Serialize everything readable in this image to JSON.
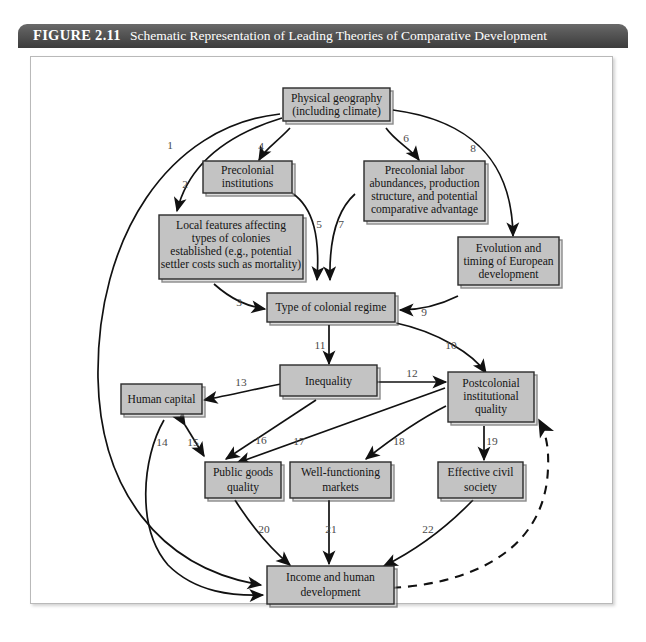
{
  "figure": {
    "number": "FIGURE 2.11",
    "title": "Schematic Representation of Leading Theories of Comparative Development"
  },
  "colors": {
    "header_bg": "#3c3c3c",
    "header_text": "#ffffff",
    "node_fill": "#c3c3c3",
    "node_border": "#2b2b2b",
    "edge": "#111111",
    "edge_label": "#4a4a4a",
    "page_bg": "#ffffff"
  },
  "diagram": {
    "type": "flowchart",
    "nodes": [
      {
        "id": "geo",
        "label": "Physical geography\n(including climate)"
      },
      {
        "id": "precol_inst",
        "label": "Precolonial\ninstitutions"
      },
      {
        "id": "precol_lab",
        "label": "Precolonial labor\nabundances, production\nstructure, and potential\ncomparative advantage"
      },
      {
        "id": "local",
        "label": "Local features affecting\ntypes of colonies\nestablished (e.g., potential\nsettler costs such as mortality)"
      },
      {
        "id": "euro",
        "label": "Evolution and\ntiming of European\ndevelopment"
      },
      {
        "id": "regime",
        "label": "Type of colonial regime"
      },
      {
        "id": "inequality",
        "label": "Inequality"
      },
      {
        "id": "postcol",
        "label": "Postcolonial\ninstitutional\nquality"
      },
      {
        "id": "human",
        "label": "Human capital"
      },
      {
        "id": "public",
        "label": "Public goods\nquality"
      },
      {
        "id": "markets",
        "label": "Well-functioning\nmarkets"
      },
      {
        "id": "civil",
        "label": "Effective civil\nsociety"
      },
      {
        "id": "income",
        "label": "Income and human\ndevelopment"
      }
    ],
    "edges": [
      {
        "label": "1",
        "from": "geo",
        "to": "income",
        "style": "solid",
        "arrows": "one"
      },
      {
        "label": "2",
        "from": "geo",
        "to": "local",
        "style": "solid",
        "arrows": "one"
      },
      {
        "label": "3",
        "from": "local",
        "to": "regime",
        "style": "solid",
        "arrows": "one"
      },
      {
        "label": "4",
        "from": "geo",
        "to": "precol_inst",
        "style": "solid",
        "arrows": "one"
      },
      {
        "label": "5",
        "from": "precol_inst",
        "to": "regime",
        "style": "solid",
        "arrows": "one"
      },
      {
        "label": "6",
        "from": "geo",
        "to": "precol_lab",
        "style": "solid",
        "arrows": "one"
      },
      {
        "label": "7",
        "from": "precol_lab",
        "to": "regime",
        "style": "solid",
        "arrows": "one"
      },
      {
        "label": "8",
        "from": "geo",
        "to": "euro",
        "style": "solid",
        "arrows": "one"
      },
      {
        "label": "9",
        "from": "euro",
        "to": "regime",
        "style": "solid",
        "arrows": "one"
      },
      {
        "label": "10",
        "from": "regime",
        "to": "postcol",
        "style": "solid",
        "arrows": "one"
      },
      {
        "label": "11",
        "from": "regime",
        "to": "inequality",
        "style": "solid",
        "arrows": "one"
      },
      {
        "label": "12",
        "from": "inequality",
        "to": "postcol",
        "style": "solid",
        "arrows": "both"
      },
      {
        "label": "13",
        "from": "inequality",
        "to": "human",
        "style": "solid",
        "arrows": "one"
      },
      {
        "label": "14",
        "from": "human",
        "to": "income",
        "style": "solid",
        "arrows": "one"
      },
      {
        "label": "15",
        "from": "human",
        "to": "public",
        "style": "solid",
        "arrows": "both"
      },
      {
        "label": "16",
        "from": "inequality",
        "to": "public",
        "style": "solid",
        "arrows": "one"
      },
      {
        "label": "17",
        "from": "postcol",
        "to": "public",
        "style": "solid",
        "arrows": "one"
      },
      {
        "label": "18",
        "from": "postcol",
        "to": "markets",
        "style": "solid",
        "arrows": "one"
      },
      {
        "label": "19",
        "from": "postcol",
        "to": "civil",
        "style": "solid",
        "arrows": "one"
      },
      {
        "label": "20",
        "from": "public",
        "to": "income",
        "style": "solid",
        "arrows": "one"
      },
      {
        "label": "21",
        "from": "markets",
        "to": "income",
        "style": "solid",
        "arrows": "one"
      },
      {
        "label": "22",
        "from": "civil",
        "to": "income",
        "style": "solid",
        "arrows": "one"
      },
      {
        "label": "",
        "from": "income",
        "to": "postcol",
        "style": "dashed",
        "arrows": "one"
      }
    ]
  }
}
